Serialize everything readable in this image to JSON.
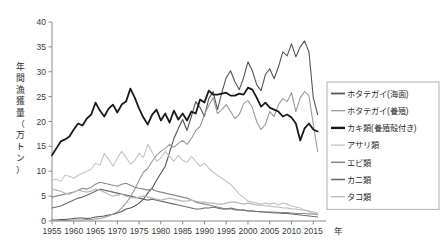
{
  "chart_data": {
    "type": "line",
    "title": "",
    "xlabel": "年",
    "ylabel": "年間漁獲量（万トン）",
    "ylabel_chars": [
      "年",
      "間",
      "漁",
      "獲",
      "量",
      "（",
      "万",
      "ト",
      "ン",
      "）"
    ],
    "xlim": [
      1955,
      2017
    ],
    "ylim": [
      0,
      40
    ],
    "yticks": [
      0,
      5,
      10,
      15,
      20,
      25,
      30,
      35,
      40
    ],
    "xticks": [
      1955,
      1960,
      1965,
      1970,
      1975,
      1980,
      1985,
      1990,
      1995,
      2000,
      2005,
      2010,
      2015
    ],
    "grid": false,
    "legend_position": "right",
    "x": [
      1955,
      1956,
      1957,
      1958,
      1959,
      1960,
      1961,
      1962,
      1963,
      1964,
      1965,
      1966,
      1967,
      1968,
      1969,
      1970,
      1971,
      1972,
      1973,
      1974,
      1975,
      1976,
      1977,
      1978,
      1979,
      1980,
      1981,
      1982,
      1983,
      1984,
      1985,
      1986,
      1987,
      1988,
      1989,
      1990,
      1991,
      1992,
      1993,
      1994,
      1995,
      1996,
      1997,
      1998,
      1999,
      2000,
      2001,
      2002,
      2003,
      2004,
      2005,
      2006,
      2007,
      2008,
      2009,
      2010,
      2011,
      2012,
      2013,
      2014,
      2015,
      2016
    ],
    "series": [
      {
        "name": "ホタテガイ（海面）",
        "color": "#555555",
        "width": 1.1,
        "values": [
          0.2,
          0.2,
          0.3,
          0.3,
          0.4,
          0.5,
          0.6,
          0.6,
          0.5,
          0.6,
          0.8,
          0.9,
          1.0,
          1.2,
          1.3,
          1.6,
          1.9,
          2.4,
          2.6,
          3.0,
          3.6,
          4.4,
          5.6,
          6.6,
          8.2,
          9.6,
          11.0,
          13.8,
          16.6,
          18.6,
          20.4,
          18.2,
          21.0,
          24.0,
          22.8,
          21.0,
          24.6,
          26.0,
          22.4,
          25.8,
          28.8,
          30.2,
          28.0,
          26.4,
          28.8,
          32.0,
          30.2,
          27.4,
          26.2,
          29.4,
          30.6,
          28.6,
          31.0,
          34.0,
          33.2,
          35.6,
          33.0,
          35.0,
          36.2,
          34.0,
          24.8,
          21.4
        ]
      },
      {
        "name": "ホタテガイ（養殖）",
        "color": "#999999",
        "width": 1.1,
        "values": [
          0.1,
          0.1,
          0.1,
          0.1,
          0.1,
          0.2,
          0.2,
          0.2,
          0.3,
          0.3,
          0.4,
          0.5,
          0.7,
          1.0,
          1.4,
          1.8,
          2.6,
          3.6,
          4.8,
          6.4,
          8.2,
          9.8,
          10.6,
          12.0,
          13.2,
          14.0,
          14.6,
          15.4,
          14.8,
          15.6,
          16.2,
          15.4,
          16.6,
          18.2,
          19.0,
          21.4,
          23.2,
          24.8,
          21.6,
          22.4,
          23.4,
          22.0,
          20.6,
          21.4,
          23.6,
          24.2,
          22.8,
          20.0,
          18.4,
          19.4,
          22.0,
          21.0,
          23.4,
          24.6,
          24.0,
          25.8,
          22.0,
          24.8,
          26.0,
          25.2,
          19.4,
          14.0
        ]
      },
      {
        "name": "カキ類（養殖殻付き）",
        "color": "#1a1a1a",
        "width": 1.8,
        "values": [
          13.2,
          14.6,
          16.0,
          16.4,
          17.0,
          18.4,
          19.6,
          19.2,
          20.6,
          21.4,
          23.8,
          22.2,
          21.0,
          22.6,
          23.4,
          21.8,
          23.4,
          24.0,
          26.6,
          24.8,
          22.6,
          20.8,
          19.4,
          21.4,
          22.4,
          20.2,
          21.6,
          19.8,
          22.2,
          20.4,
          21.6,
          20.2,
          22.0,
          21.6,
          24.4,
          23.8,
          26.2,
          25.4,
          25.4,
          25.6,
          25.8,
          25.2,
          25.2,
          25.6,
          25.4,
          26.8,
          26.4,
          24.8,
          23.0,
          23.8,
          22.8,
          22.4,
          22.0,
          21.0,
          21.4,
          20.8,
          19.6,
          16.2,
          18.6,
          19.6,
          18.4,
          18.0
        ]
      },
      {
        "name": "アサリ類",
        "color": "#c4c4c4",
        "width": 1.1,
        "values": [
          8.2,
          8.4,
          8.0,
          9.2,
          9.0,
          8.6,
          9.2,
          9.6,
          10.0,
          10.4,
          11.6,
          11.2,
          13.6,
          12.4,
          11.0,
          12.6,
          14.0,
          12.8,
          11.4,
          12.2,
          13.6,
          12.8,
          15.4,
          13.8,
          12.0,
          12.6,
          14.0,
          13.0,
          12.0,
          13.2,
          12.2,
          11.8,
          13.0,
          12.0,
          11.0,
          11.6,
          10.6,
          9.8,
          9.2,
          8.6,
          8.0,
          7.4,
          6.4,
          5.4,
          4.8,
          4.0,
          3.8,
          3.6,
          3.4,
          3.6,
          3.4,
          3.6,
          3.2,
          3.6,
          3.4,
          3.0,
          2.8,
          2.6,
          2.2,
          1.8,
          1.4,
          1.2
        ]
      },
      {
        "name": "エビ類",
        "color": "#8a8a8a",
        "width": 1.1,
        "values": [
          4.8,
          5.0,
          5.2,
          5.4,
          5.6,
          5.8,
          6.2,
          6.6,
          6.4,
          6.8,
          7.4,
          7.8,
          7.6,
          7.4,
          7.2,
          7.0,
          7.4,
          7.6,
          7.2,
          6.8,
          6.6,
          6.4,
          6.2,
          6.4,
          6.0,
          5.8,
          5.6,
          5.4,
          5.2,
          5.0,
          4.8,
          4.6,
          4.2,
          3.8,
          3.6,
          3.4,
          3.2,
          3.0,
          2.8,
          2.6,
          2.4,
          2.4,
          2.2,
          2.2,
          2.2,
          2.0,
          2.0,
          1.9,
          1.9,
          1.8,
          1.8,
          1.8,
          1.7,
          1.7,
          1.7,
          1.6,
          1.5,
          1.5,
          1.5,
          1.4,
          1.4,
          1.4
        ]
      },
      {
        "name": "カニ類",
        "color": "#6b6b6b",
        "width": 1.1,
        "values": [
          2.6,
          2.8,
          3.0,
          3.4,
          3.8,
          4.2,
          4.6,
          4.8,
          5.2,
          5.6,
          6.0,
          6.4,
          6.2,
          6.0,
          5.8,
          5.6,
          5.4,
          5.2,
          5.0,
          4.8,
          4.6,
          4.4,
          4.2,
          4.4,
          4.2,
          4.0,
          3.8,
          3.6,
          3.4,
          3.2,
          3.0,
          2.8,
          2.6,
          2.4,
          2.4,
          2.6,
          2.6,
          2.8,
          2.6,
          2.4,
          2.4,
          2.6,
          2.4,
          2.2,
          2.2,
          2.0,
          2.0,
          1.9,
          1.8,
          1.8,
          1.7,
          1.6,
          1.6,
          1.5,
          1.5,
          1.4,
          1.3,
          1.2,
          1.1,
          1.0,
          0.9,
          0.8
        ]
      },
      {
        "name": "タコ類",
        "color": "#b8b8b8",
        "width": 1.1,
        "values": [
          6.4,
          6.2,
          6.0,
          5.6,
          5.4,
          5.8,
          6.2,
          6.0,
          5.8,
          6.0,
          6.4,
          6.2,
          5.8,
          5.4,
          5.0,
          5.2,
          5.4,
          5.0,
          4.8,
          4.6,
          4.8,
          5.0,
          4.8,
          4.6,
          4.4,
          4.2,
          4.4,
          4.6,
          4.4,
          4.2,
          4.0,
          4.0,
          4.2,
          4.0,
          3.8,
          3.8,
          3.6,
          3.6,
          3.4,
          3.4,
          3.6,
          3.8,
          3.8,
          3.6,
          3.4,
          3.6,
          3.4,
          3.2,
          3.2,
          3.0,
          3.0,
          2.8,
          2.8,
          2.6,
          2.6,
          2.4,
          2.4,
          2.2,
          2.2,
          2.0,
          1.8,
          1.6
        ]
      }
    ]
  },
  "legend": {
    "items": [
      {
        "label": "ホタテガイ(海面)",
        "color": "#555555",
        "width": 1.8
      },
      {
        "label": "ホタテガイ(養殖)",
        "color": "#999999",
        "width": 1.3
      },
      {
        "label": "カキ類(養殖殻付き)",
        "color": "#1a1a1a",
        "width": 2.4
      },
      {
        "label": "アサリ類",
        "color": "#c4c4c4",
        "width": 1.3
      },
      {
        "label": "エビ類",
        "color": "#8a8a8a",
        "width": 1.6
      },
      {
        "label": "カニ類",
        "color": "#6b6b6b",
        "width": 1.6
      },
      {
        "label": "タコ類",
        "color": "#b8b8b8",
        "width": 1.3
      }
    ]
  }
}
